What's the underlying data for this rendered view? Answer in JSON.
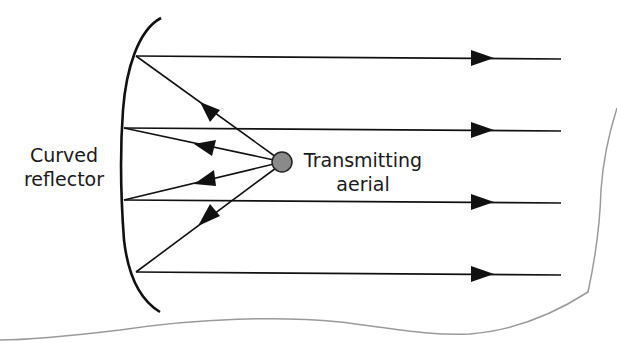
{
  "diagram": {
    "labels": {
      "reflector_line1": "Curved",
      "reflector_line2": "reflector",
      "aerial_line1": "Transmitting",
      "aerial_line2": "aerial"
    },
    "colors": {
      "line": "#111111",
      "aerial_fill": "#8a8a8a",
      "page_edge": "#9a9a9a",
      "background": "#ffffff"
    },
    "elements": {
      "reflector": "curved-reflector",
      "aerial": "transmitting-aerial",
      "parallel_rays": 4,
      "incident_rays": 4
    }
  }
}
